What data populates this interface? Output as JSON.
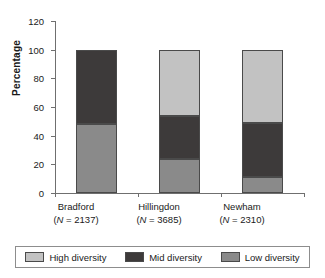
{
  "chart_data": {
    "type": "bar",
    "subtype": "stacked-vertical",
    "title": "",
    "xlabel": "",
    "ylabel": "Percentage",
    "ylim": [
      0,
      120
    ],
    "yticks": [
      0,
      20,
      40,
      60,
      80,
      100,
      120
    ],
    "grid": false,
    "legend_position": "bottom",
    "categories": [
      "Bradford",
      "Hillingdon",
      "Newham"
    ],
    "category_sublabels": [
      "(N = 2137)",
      "(N = 3685)",
      "(N = 2310)"
    ],
    "category_n": [
      2137,
      3685,
      2310
    ],
    "series": [
      {
        "name": "Low diversity",
        "color": "#8a8a8a",
        "values": [
          48,
          24,
          11
        ]
      },
      {
        "name": "Mid diversity",
        "color": "#3d3a3a",
        "values": [
          52,
          30,
          38
        ]
      },
      {
        "name": "High diversity",
        "color": "#c2c2c2",
        "values": [
          0,
          46,
          51
        ]
      }
    ],
    "totals": [
      100,
      100,
      100
    ]
  },
  "axis": {
    "y_title": "Percentage",
    "y_tick_labels": [
      "0",
      "20",
      "40",
      "60",
      "80",
      "100",
      "120"
    ]
  },
  "categories": [
    {
      "name": "Bradford",
      "sublabel": "(N = 2137)",
      "n_prefix": "N",
      "n_value": "= 2137"
    },
    {
      "name": "Hillingdon",
      "sublabel": "(N = 3685)",
      "n_prefix": "N",
      "n_value": "= 3685"
    },
    {
      "name": "Newham",
      "sublabel": "(N = 2310)",
      "n_prefix": "N",
      "n_value": "= 2310"
    }
  ],
  "legend": {
    "items": [
      {
        "label": "High diversity",
        "color": "#c2c2c2"
      },
      {
        "label": "Mid diversity",
        "color": "#3d3a3a"
      },
      {
        "label": "Low diversity",
        "color": "#8a8a8a"
      }
    ]
  }
}
